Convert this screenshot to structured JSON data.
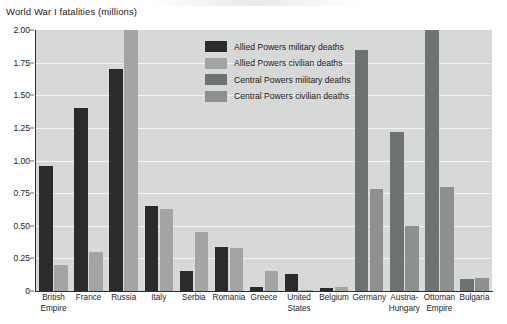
{
  "chart_data": {
    "type": "bar",
    "title": "World War I fatalities (millions)",
    "xlabel": "",
    "ylabel": "",
    "ylim": [
      0,
      2.0
    ],
    "ytick_labels": [
      "2.00",
      "1.75",
      "1.50",
      "1.25",
      "1.00",
      "0.75",
      "0.50",
      "0.25",
      "0"
    ],
    "ytick_values": [
      2.0,
      1.75,
      1.5,
      1.25,
      1.0,
      0.75,
      0.5,
      0.25,
      0
    ],
    "grid": true,
    "legend_position": "inside top-center",
    "categories": [
      "British Empire",
      "France",
      "Russia",
      "Italy",
      "Serbia",
      "Romania",
      "Greece",
      "United States",
      "Belgium",
      "Germany",
      "Austria-Hungary",
      "Ottoman Empire",
      "Bulgaria"
    ],
    "series": [
      {
        "name": "Allied Powers military deaths",
        "color": "#2b2b2b",
        "values": [
          0.96,
          1.4,
          1.7,
          0.65,
          0.15,
          0.34,
          0.03,
          0.13,
          0.02,
          null,
          null,
          null,
          null
        ]
      },
      {
        "name": "Allied Powers civilian deaths",
        "color": "#a3a5a4",
        "values": [
          0.2,
          0.3,
          2.0,
          0.63,
          0.45,
          0.33,
          0.15,
          0.0,
          0.03,
          null,
          null,
          null,
          null
        ]
      },
      {
        "name": "Central Powers military deaths",
        "color": "#6e7271",
        "values": [
          null,
          null,
          null,
          null,
          null,
          null,
          null,
          null,
          null,
          1.85,
          1.22,
          2.0,
          0.09
        ]
      },
      {
        "name": "Central Powers civilian deaths",
        "color": "#8d908f",
        "values": [
          null,
          null,
          null,
          null,
          null,
          null,
          null,
          null,
          null,
          0.78,
          0.5,
          0.8,
          0.1
        ]
      }
    ],
    "notes": {
      "clipped_bars": [
        "Russia Allied Powers civilian deaths",
        "Ottoman Empire Central Powers military deaths"
      ],
      "plot_background": "#d7d9d8",
      "gridline_color": "#f3f4f3",
      "axis_color": "#2f2f2f"
    }
  },
  "legend": {
    "items": [
      {
        "label": "Allied Powers military deaths",
        "color": "#2b2b2b"
      },
      {
        "label": "Allied Powers civilian deaths",
        "color": "#a3a5a4"
      },
      {
        "label": "Central Powers military deaths",
        "color": "#6e7271"
      },
      {
        "label": "Central Powers civilian deaths",
        "color": "#8d908f"
      }
    ]
  }
}
